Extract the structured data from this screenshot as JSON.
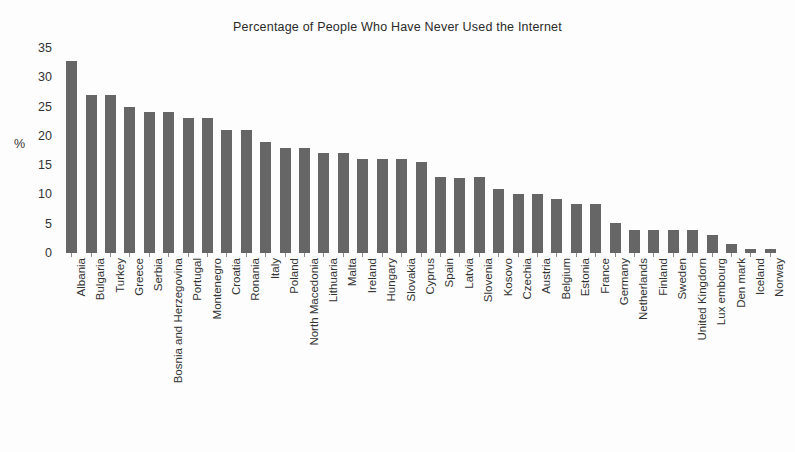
{
  "chart_data": {
    "type": "bar",
    "title": "Percentage of People Who Have Never Used the Internet",
    "xlabel": "",
    "ylabel": "%",
    "ylim": [
      0,
      35
    ],
    "yticks": [
      0,
      5,
      10,
      15,
      20,
      25,
      30,
      35
    ],
    "grid": false,
    "legend": null,
    "bar_color": "#666666",
    "categories": [
      "Albania",
      "Bulgaria",
      "Turkey",
      "Greece",
      "Serbia",
      "Bosnia and Herzegovina",
      "Portugal",
      "Montenegro",
      "Croatia",
      "Ronania",
      "Italy",
      "Poland",
      "North Macedonia",
      "Lithuaria",
      "Malta",
      "Ireland",
      "Hungary",
      "Slovakia",
      "Cyprus",
      "Spain",
      "Latvia",
      "Slovenia",
      "Kosovo",
      "Czechia",
      "Austria",
      "Belgium",
      "Estonia",
      "France",
      "Germany",
      "Netherlands",
      "Finland",
      "Sweden",
      "United Kingdorn",
      "Lux embourg",
      "Den mark",
      "Iceland",
      "Norway"
    ],
    "values": [
      32.8,
      27.0,
      27.0,
      25.0,
      24.0,
      24.0,
      23.0,
      23.0,
      21.0,
      21.0,
      19.0,
      18.0,
      18.0,
      17.0,
      17.0,
      16.0,
      16.0,
      16.0,
      15.5,
      13.0,
      12.8,
      13.0,
      11.0,
      10.0,
      10.0,
      9.2,
      8.3,
      8.3,
      5.1,
      4.0,
      4.0,
      4.0,
      4.0,
      3.1,
      1.5,
      0.7,
      0.7
    ]
  }
}
